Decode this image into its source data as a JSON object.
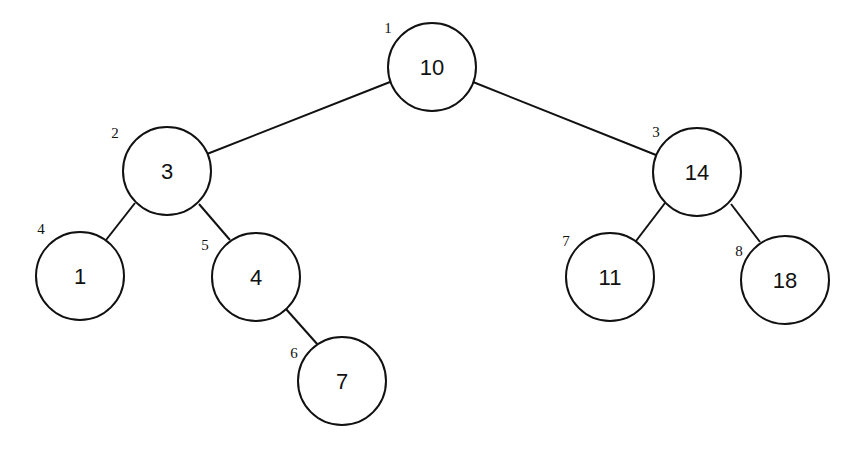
{
  "diagram": {
    "type": "binary-search-tree",
    "nodes": [
      {
        "id": "n1",
        "index": "1",
        "value": "10",
        "cx": 432,
        "cy": 67,
        "lx": 388,
        "ly": 28
      },
      {
        "id": "n2",
        "index": "2",
        "value": "3",
        "cx": 167,
        "cy": 171,
        "lx": 115,
        "ly": 133
      },
      {
        "id": "n3",
        "index": "3",
        "value": "14",
        "cx": 697,
        "cy": 172,
        "lx": 656,
        "ly": 132
      },
      {
        "id": "n4",
        "index": "4",
        "value": "1",
        "cx": 80,
        "cy": 276,
        "lx": 41,
        "ly": 229
      },
      {
        "id": "n5",
        "index": "5",
        "value": "4",
        "cx": 256,
        "cy": 277,
        "lx": 205,
        "ly": 245
      },
      {
        "id": "n6",
        "index": "6",
        "value": "7",
        "cx": 342,
        "cy": 381,
        "lx": 294,
        "ly": 353
      },
      {
        "id": "n7",
        "index": "7",
        "value": "11",
        "cx": 610,
        "cy": 277,
        "lx": 566,
        "ly": 241
      },
      {
        "id": "n8",
        "index": "8",
        "value": "18",
        "cx": 785,
        "cy": 280,
        "lx": 739,
        "ly": 251
      }
    ],
    "edges": [
      {
        "from": "n1",
        "to": "n2",
        "x1": 390,
        "y1": 82,
        "x2": 207,
        "y2": 154
      },
      {
        "from": "n1",
        "to": "n3",
        "x1": 473,
        "y1": 82,
        "x2": 656,
        "y2": 155
      },
      {
        "from": "n2",
        "to": "n4",
        "x1": 135,
        "y1": 203,
        "x2": 106,
        "y2": 240
      },
      {
        "from": "n2",
        "to": "n5",
        "x1": 199,
        "y1": 204,
        "x2": 230,
        "y2": 240
      },
      {
        "from": "n5",
        "to": "n6",
        "x1": 286,
        "y1": 309,
        "x2": 318,
        "y2": 345
      },
      {
        "from": "n3",
        "to": "n7",
        "x1": 665,
        "y1": 203,
        "x2": 636,
        "y2": 241
      },
      {
        "from": "n3",
        "to": "n8",
        "x1": 731,
        "y1": 204,
        "x2": 760,
        "y2": 242
      }
    ],
    "radius": 44
  }
}
